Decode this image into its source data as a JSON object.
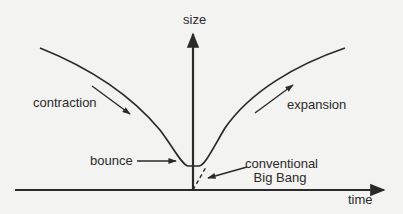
{
  "diagram": {
    "type": "schematic-plot",
    "axes": {
      "y_label": "size",
      "x_label": "time"
    },
    "labels": {
      "contraction": "contraction",
      "expansion": "expansion",
      "bounce": "bounce",
      "conventional_big_bang_line1": "conventional",
      "conventional_big_bang_line2": "Big Bang"
    },
    "curves": [
      {
        "name": "contraction",
        "description": "size decreasing toward bounce"
      },
      {
        "name": "expansion",
        "description": "size increasing after bounce"
      },
      {
        "name": "conventional-big-bang",
        "style": "dashed",
        "description": "extrapolation to zero size"
      }
    ],
    "colors": {
      "ink": "#2a2a2a",
      "background": "#f3f3f1"
    }
  }
}
